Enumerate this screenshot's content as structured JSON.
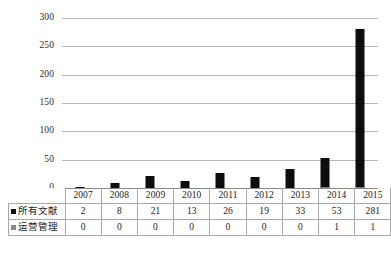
{
  "chart_data": {
    "type": "bar",
    "title": "",
    "subtitle": "",
    "xlabel": "",
    "ylabel": "",
    "categories": [
      "2007",
      "2008",
      "2009",
      "2010",
      "2011",
      "2012",
      "2013",
      "2014",
      "2015"
    ],
    "series": [
      {
        "name": "所有文献",
        "color": "#0d0d0d",
        "values": [
          2,
          8,
          21,
          13,
          26,
          19,
          33,
          53,
          281
        ]
      },
      {
        "name": "运营管理",
        "color": "#7d7d7d",
        "values": [
          0,
          0,
          0,
          0,
          0,
          0,
          0,
          1,
          1
        ]
      }
    ],
    "ylim": [
      0,
      300
    ],
    "yticks": [
      0,
      50,
      100,
      150,
      200,
      250,
      300
    ],
    "ytick_labels": [
      "0",
      "50",
      "100",
      "150",
      "200",
      "250",
      "300"
    ],
    "grid": true,
    "legend_position": "table-left",
    "data_table_visible": true,
    "annotations": []
  },
  "table": {
    "legend_labels": [
      "所有文献",
      "运营管理"
    ],
    "header": [
      "2007",
      "2008",
      "2009",
      "2010",
      "2011",
      "2012",
      "2013",
      "2014",
      "2015"
    ],
    "rows": [
      [
        "2",
        "8",
        "21",
        "13",
        "26",
        "19",
        "33",
        "53",
        "281"
      ],
      [
        "0",
        "0",
        "0",
        "0",
        "0",
        "0",
        "0",
        "1",
        "1"
      ]
    ]
  }
}
